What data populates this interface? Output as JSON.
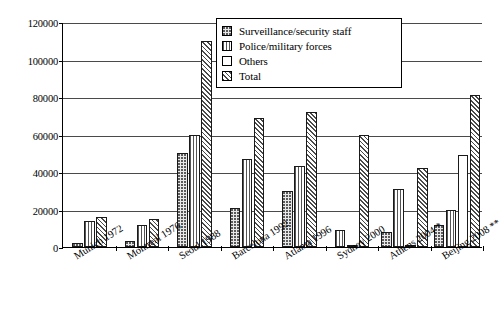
{
  "chart_data": {
    "type": "bar",
    "title": "",
    "xlabel": "",
    "ylabel": "",
    "ylim": [
      0,
      120000
    ],
    "ytick_step": 20000,
    "yticks": [
      "0",
      "20000",
      "40000",
      "60000",
      "80000",
      "100000",
      "120000"
    ],
    "grid": true,
    "legend_position": "top-right",
    "categories": [
      "Munich 1972",
      "Montreal 1976",
      "Seoul 1988",
      "Barcelona 1992",
      "Atlanta 1996",
      "Sydney 2000",
      "Athens 2004 *",
      "Beijing 2008 **"
    ],
    "series": [
      {
        "name": "Surveillance/security staff",
        "pattern": "dotted",
        "values": [
          2000,
          3000,
          50000,
          21000,
          30000,
          null,
          8000,
          12000
        ]
      },
      {
        "name": "Police/military forces",
        "pattern": "vertical-lines",
        "values": [
          14000,
          12000,
          60000,
          47000,
          43000,
          9000,
          31000,
          20000
        ]
      },
      {
        "name": "Others",
        "pattern": "white",
        "values": [
          null,
          null,
          null,
          null,
          null,
          1000,
          1000,
          49000
        ]
      },
      {
        "name": "Total",
        "pattern": "diagonal-hatch",
        "values": [
          16000,
          15000,
          110000,
          69000,
          72000,
          60000,
          42000,
          81000
        ]
      }
    ]
  },
  "legend": {
    "items": [
      {
        "label": "Surveillance/security staff",
        "swatch": "dotted-swatch"
      },
      {
        "label": "Police/military forces",
        "swatch": "vertical-lines-swatch"
      },
      {
        "label": "Others",
        "swatch": "white-swatch"
      },
      {
        "label": "Total",
        "swatch": "diagonal-hatch-swatch"
      }
    ]
  }
}
